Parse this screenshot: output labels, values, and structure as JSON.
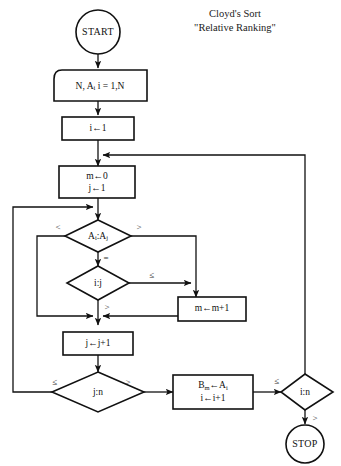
{
  "canvas": {
    "width": 341,
    "height": 466,
    "background": "#ffffff",
    "stroke": "#111111"
  },
  "title": {
    "line1": "Cloyd's Sort",
    "line2": "\"Relative Ranking\""
  },
  "nodes": {
    "start": {
      "label": "START",
      "shape": "terminator-circle"
    },
    "input": {
      "label": "N, A",
      "sub": "i",
      "tail": "  i = 1,N",
      "shape": "input-parallelogram"
    },
    "init_i": {
      "label": "i←1",
      "shape": "process-box"
    },
    "init_mj": {
      "line1": "m←0",
      "line2": "j←1",
      "shape": "process-box"
    },
    "cmp_a": {
      "label": "A",
      "sub1": "i",
      "mid": ":A",
      "sub2": "j",
      "shape": "decision-diamond"
    },
    "cmp_ij": {
      "label": "i:j",
      "shape": "decision-diamond"
    },
    "inc_m": {
      "label": "m←m+1",
      "shape": "process-box"
    },
    "inc_j": {
      "label": "j←j+1",
      "shape": "process-box"
    },
    "cmp_jn": {
      "label": "j:n",
      "shape": "decision-diamond"
    },
    "assign_b": {
      "line1": "B",
      "sub1": "m",
      "mid1": "←A",
      "sub2": "i",
      "line2": "i←i+1",
      "shape": "process-box"
    },
    "cmp_in": {
      "label": "i:n",
      "shape": "decision-diamond"
    },
    "stop": {
      "label": "STOP",
      "shape": "terminator-circle"
    }
  },
  "edge_labels": {
    "a_less": "<",
    "a_greater": ">",
    "a_equal": "=",
    "ij_le": "≤",
    "ij_gt": ">",
    "jn_le": "≤",
    "jn_gt": ">",
    "in_le": "≤",
    "in_gt": ">"
  }
}
